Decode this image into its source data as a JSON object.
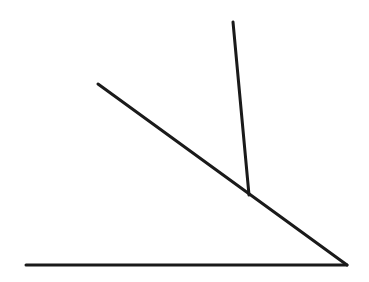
{
  "diagram": {
    "type": "geometry-lines",
    "background": "#ffffff",
    "stroke_color": "#1a1a1a",
    "stroke_width": 3,
    "segments": [
      {
        "id": "base-line",
        "x1": 26,
        "y1": 265,
        "x2": 347,
        "y2": 265
      },
      {
        "id": "diagonal-line",
        "x1": 98,
        "y1": 84,
        "x2": 347,
        "y2": 265
      },
      {
        "id": "upright-line",
        "x1": 233,
        "y1": 22,
        "x2": 249,
        "y2": 195
      }
    ],
    "points": {
      "vertex": {
        "x": 347,
        "y": 265
      },
      "intersection": {
        "x": 249,
        "y": 195
      }
    }
  }
}
